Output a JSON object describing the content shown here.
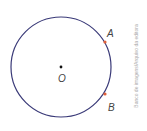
{
  "diagram": {
    "center_label": "O",
    "points": [
      {
        "label": "A",
        "color": "#e0603a"
      },
      {
        "label": "B",
        "color": "#e0603a"
      }
    ],
    "circle_color": "#3a3a78",
    "center_color": "#111111"
  },
  "credit": "Banco de imagens/Arquivo da editora"
}
